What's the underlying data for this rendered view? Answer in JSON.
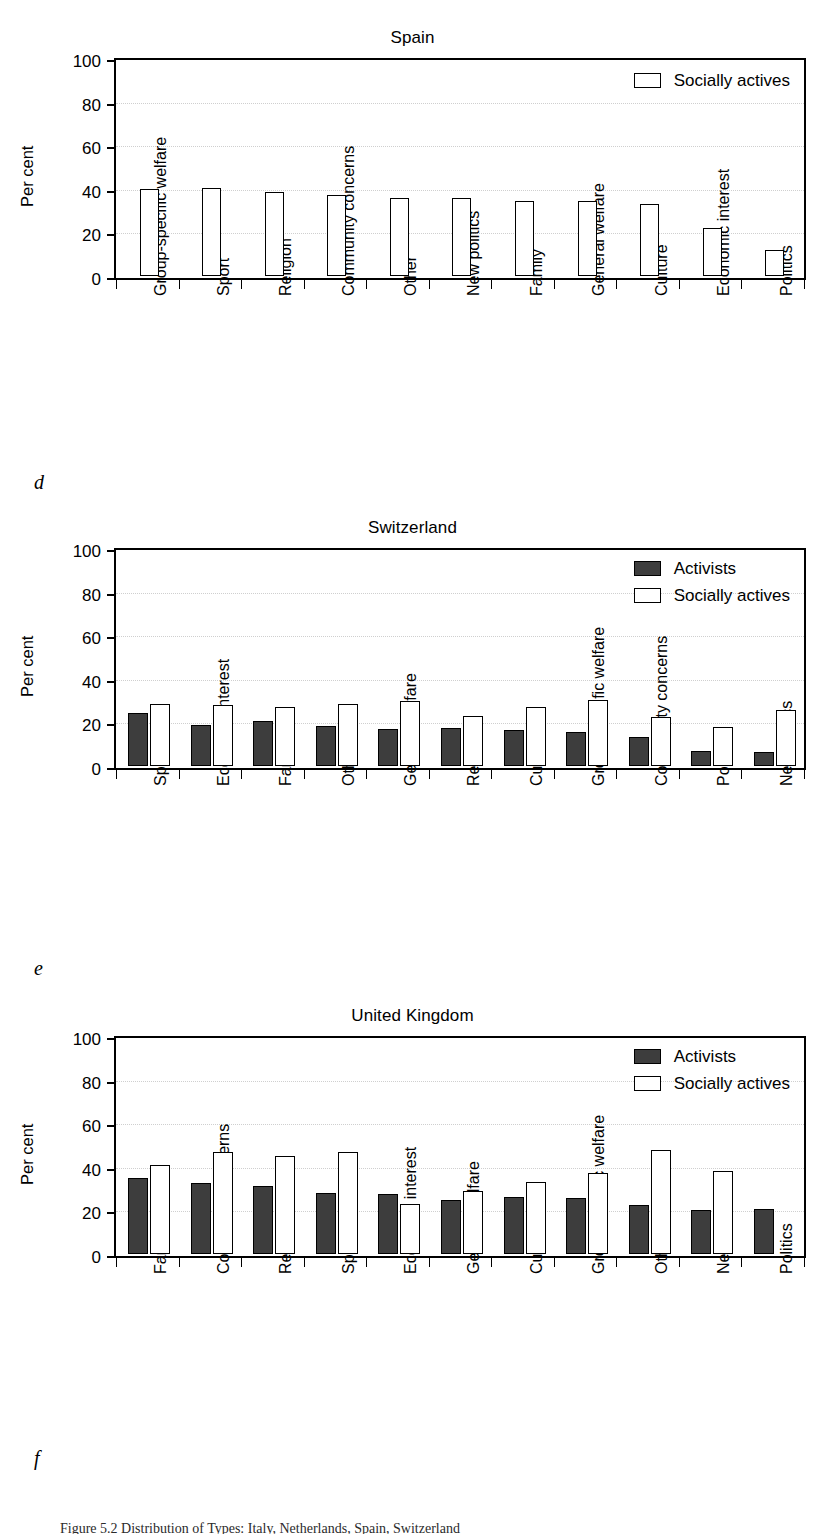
{
  "figure": {
    "caption": "Figure 5.2   Distribution of Types: Italy, Netherlands, Spain, Switzerland",
    "axis": {
      "y_label": "Per cent",
      "y_ticks": [
        0,
        20,
        40,
        60,
        80,
        100
      ],
      "y_min": 0,
      "y_max": 100
    },
    "series_names": {
      "activists": "Activists",
      "socially_actives": "Socially actives"
    },
    "colors": {
      "activists": "#3d3d3d",
      "socially_actives": "#ffffff",
      "outline": "#000000",
      "gridline": "#cfcfcf"
    }
  },
  "panels": [
    {
      "id": "spain",
      "label": "d",
      "title": "Spain",
      "legend": [
        "Socially actives"
      ],
      "chart_data": {
        "type": "bar",
        "title": "Spain",
        "xlabel": "",
        "ylabel": "Per cent",
        "ylim": [
          0,
          100
        ],
        "grid": true,
        "legend_position": "top-right",
        "categories": [
          "Group-specific welfare",
          "Sport",
          "Religion",
          "Community concerns",
          "Other",
          "New politics",
          "Family",
          "General welfare",
          "Culture",
          "Economic interest",
          "Politics"
        ],
        "series": [
          {
            "name": "Socially actives",
            "values": [
              40,
              40.5,
              38.5,
              37,
              36,
              36,
              34.5,
              34.5,
              33,
              22,
              12
            ]
          }
        ]
      }
    },
    {
      "id": "switzerland",
      "label": "e",
      "title": "Switzerland",
      "legend": [
        "Activists",
        "Socially actives"
      ],
      "chart_data": {
        "type": "bar",
        "title": "Switzerland",
        "xlabel": "",
        "ylabel": "Per cent",
        "ylim": [
          0,
          100
        ],
        "grid": true,
        "legend_position": "top-right",
        "categories": [
          "Sport",
          "Economic interest",
          "Family",
          "Other",
          "General welfare",
          "Religion",
          "Culture",
          "Group-specific welfare",
          "Community concerns",
          "Politics",
          "New politics"
        ],
        "series": [
          {
            "name": "Activists",
            "values": [
              24.5,
              19,
              20.5,
              18.5,
              17,
              17.5,
              16.5,
              15.5,
              13.5,
              7,
              6.5
            ]
          },
          {
            "name": "Socially actives",
            "values": [
              28.5,
              28,
              27,
              28.5,
              30,
              23,
              27,
              30.5,
              22.5,
              18,
              25.5
            ]
          }
        ]
      }
    },
    {
      "id": "united-kingdom",
      "label": "f",
      "title": "United Kingdom",
      "legend": [
        "Activists",
        "Socially actives"
      ],
      "chart_data": {
        "type": "bar",
        "title": "United Kingdom",
        "xlabel": "",
        "ylabel": "Per cent",
        "ylim": [
          0,
          100
        ],
        "grid": true,
        "legend_position": "top-right",
        "categories": [
          "Family",
          "Community concerns",
          "Religion",
          "Sport",
          "Economic interest",
          "General welfare",
          "Culture",
          "Group-specific welfare",
          "Other",
          "New politics",
          "Politics"
        ],
        "series": [
          {
            "name": "Activists",
            "values": [
              35,
              32.5,
              31,
              28,
              27.5,
              25,
              26,
              25.5,
              22.5,
              20,
              20.5
            ]
          },
          {
            "name": "Socially actives",
            "values": [
              41,
              47,
              45,
              47,
              23,
              29,
              33,
              37,
              47.5,
              38,
              null
            ]
          }
        ]
      }
    }
  ]
}
